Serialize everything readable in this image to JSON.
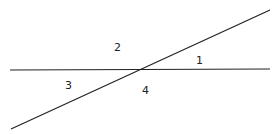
{
  "diagram": {
    "type": "intersecting-lines",
    "lines": [
      {
        "name": "horizontal-line",
        "x1": 10,
        "y1": 70,
        "x2": 270,
        "y2": 69
      },
      {
        "name": "diagonal-line",
        "x1": 11,
        "y1": 129,
        "x2": 270,
        "y2": 10
      }
    ],
    "intersection": {
      "x": 141,
      "y": 70
    },
    "angle_labels": [
      {
        "label": "1",
        "x": 196,
        "y": 64
      },
      {
        "label": "2",
        "x": 118,
        "y": 51
      },
      {
        "label": "3",
        "x": 69,
        "y": 89
      },
      {
        "label": "4",
        "x": 146,
        "y": 94
      }
    ],
    "stroke_color": "#222222",
    "background": "#ffffff"
  }
}
